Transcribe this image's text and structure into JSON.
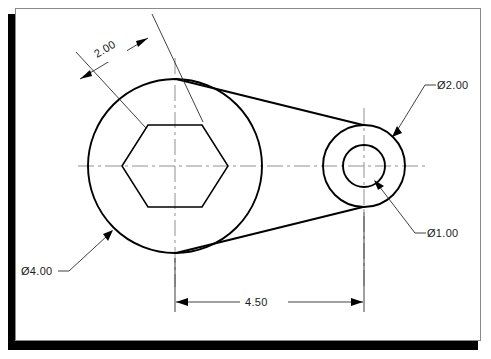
{
  "drawing": {
    "title": "Mechanical part orthographic drawing",
    "sheet": {
      "background_color": "#ffffff",
      "frame_color": "#8a8a8a",
      "shadow_color": "#000000"
    },
    "line_colors": {
      "object": "#000000",
      "center": "#909090",
      "dimension": "#2b2b2b",
      "text": "#1a1a1a"
    },
    "dimensions": [
      {
        "id": "hex-across-flats",
        "label": "2.00",
        "type": "linear-aligned",
        "value": 2.0,
        "feature": "hexagon across flats"
      },
      {
        "id": "large-bore-diameter",
        "label": "Ø4.00",
        "type": "diameter-leader",
        "value": 4.0,
        "feature": "large boss outer circle"
      },
      {
        "id": "small-boss-diameter",
        "label": "Ø2.00",
        "type": "diameter-leader",
        "value": 2.0,
        "feature": "small boss outer circle"
      },
      {
        "id": "small-bore-diameter",
        "label": "Ø1.00",
        "type": "diameter-leader",
        "value": 1.0,
        "feature": "small boss inner hole"
      },
      {
        "id": "center-distance",
        "label": "4.50",
        "type": "linear-horizontal",
        "value": 4.5,
        "feature": "distance between boss centers"
      }
    ],
    "geometry": {
      "large_circle": {
        "cx": 175,
        "cy": 166,
        "r": 87
      },
      "hexagon": {
        "cx": 175,
        "cy": 166,
        "across_corners_r": 53
      },
      "small_outer_circle": {
        "cx": 364,
        "cy": 166,
        "r": 41
      },
      "small_inner_circle": {
        "cx": 364,
        "cy": 166,
        "r": 21
      }
    }
  }
}
